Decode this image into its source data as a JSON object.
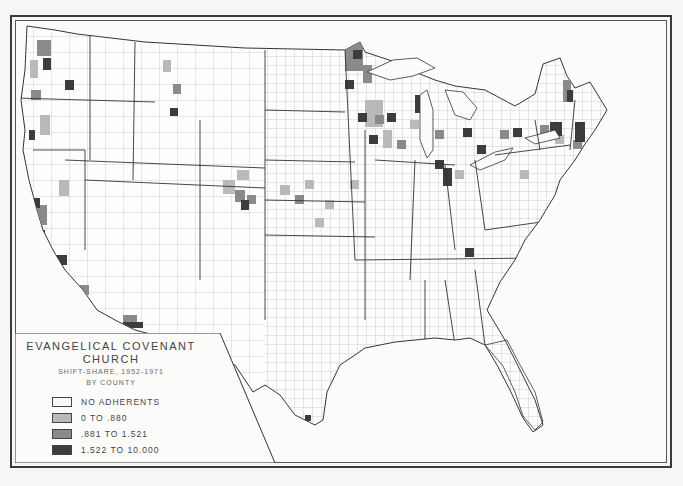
{
  "legend": {
    "title_line1": "EVANGELICAL COVENANT",
    "title_line2": "CHURCH",
    "subtitle_line1": "SHIFT-SHARE, 1952-1971",
    "subtitle_line2": "BY COUNTY",
    "classes": [
      {
        "label": "NO ADHERENTS",
        "color": "#f8f8f6"
      },
      {
        "label": "0 TO .880",
        "color": "#b9b9b9"
      },
      {
        "label": ".881 TO 1.521",
        "color": "#8a8a8a"
      },
      {
        "label": "1.522 TO 10.000",
        "color": "#3c3c3c"
      }
    ]
  },
  "map": {
    "subject": "Contiguous United States by county",
    "shaded_regions": [
      "Western Washington (Puget Sound)",
      "Northern Idaho / Montana",
      "Oregon (Willamette Valley)",
      "Northern & Central California (Bay Area, Central Valley, Los Angeles)",
      "Southern Arizona",
      "Colorado Front Range",
      "Nebraska & Kansas",
      "Minnesota",
      "Wisconsin",
      "Michigan",
      "Iowa",
      "Illinois (Chicago)",
      "Indiana & Ohio",
      "New York & Pennsylvania",
      "New England & Northern Maine",
      "Tennessee",
      "Southeast Florida"
    ]
  }
}
